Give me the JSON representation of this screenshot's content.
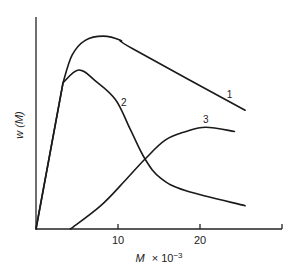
{
  "chart_data": {
    "type": "line",
    "title": "",
    "xlabel": "M × 10⁻³",
    "xlabel_main": "M",
    "xlabel_suffix": "× 10",
    "xlabel_exp": "−3",
    "ylabel": "w (M)",
    "xlim": [
      0,
      30
    ],
    "ylim": [
      0,
      100
    ],
    "x_ticks": [
      10,
      20,
      30
    ],
    "x_tick_labels": [
      "10",
      "20",
      ""
    ],
    "grid": false,
    "legend": "none (curves labeled inline 1, 2, 3)",
    "series": [
      {
        "name": "1",
        "label_pos": [
          23.6,
          62
        ],
        "points": [
          [
            0,
            0
          ],
          [
            3.3,
            69
          ],
          [
            4.4,
            82
          ],
          [
            6.0,
            89
          ],
          [
            8.2,
            91
          ],
          [
            10.3,
            89
          ],
          [
            11.8,
            85
          ],
          [
            25.5,
            56
          ]
        ]
      },
      {
        "name": "2",
        "label_pos": [
          10.7,
          58
        ],
        "points": [
          [
            0,
            0
          ],
          [
            3.3,
            69
          ],
          [
            5.2,
            75
          ],
          [
            7.2,
            70
          ],
          [
            9.7,
            61
          ],
          [
            11.5,
            47
          ],
          [
            13.3,
            33
          ],
          [
            15.2,
            24
          ],
          [
            18.3,
            18
          ],
          [
            25.5,
            11
          ]
        ]
      },
      {
        "name": "3",
        "label_pos": [
          20.7,
          50
        ],
        "points": [
          [
            4.2,
            0
          ],
          [
            7.9,
            11
          ],
          [
            10.9,
            23
          ],
          [
            13.3,
            33
          ],
          [
            15.8,
            42
          ],
          [
            18.3,
            46
          ],
          [
            20.7,
            48
          ],
          [
            24.2,
            46
          ]
        ]
      }
    ],
    "annotations": [
      "1",
      "2",
      "3"
    ]
  }
}
